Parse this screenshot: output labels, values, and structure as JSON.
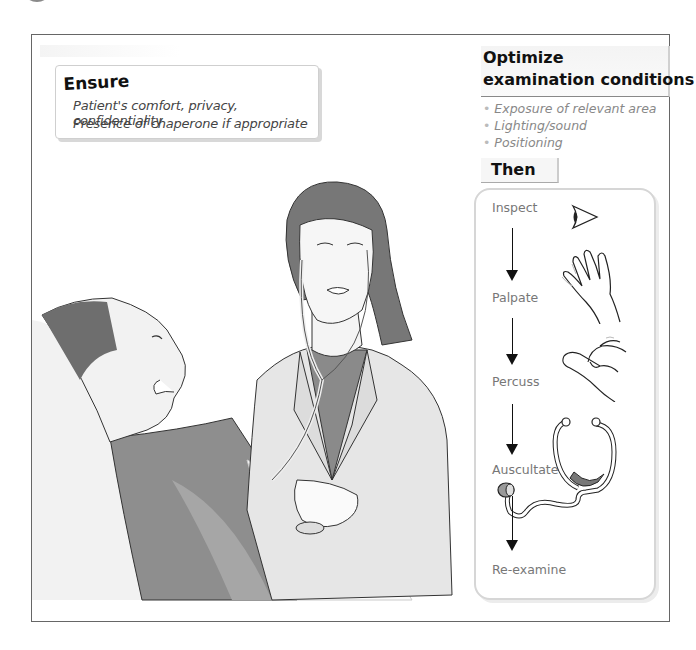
{
  "ensure": {
    "title": "Ensure",
    "items": [
      "Patient's comfort, privacy, confidentiality",
      "Presence of chaperone if appropriate"
    ]
  },
  "optimize": {
    "title_line1": "Optimize",
    "title_line2": "examination conditions",
    "bullets": [
      "Exposure of relevant area",
      "Lighting/sound",
      "Positioning"
    ]
  },
  "then": {
    "label": "Then",
    "steps": [
      {
        "label": "Inspect",
        "icon": "eye-icon"
      },
      {
        "label": "Palpate",
        "icon": "hand-icon"
      },
      {
        "label": "Percuss",
        "icon": "fingers-tapping-icon"
      },
      {
        "label": "Auscultate",
        "icon": "stethoscope-icon"
      },
      {
        "label": "Re-examine",
        "icon": ""
      }
    ]
  },
  "illustration": {
    "description": "Doctor with stethoscope examining reclining patient"
  },
  "colors": {
    "frame": "#666666",
    "accent_gray": "#8a8a8a",
    "arrow": "#111111"
  }
}
